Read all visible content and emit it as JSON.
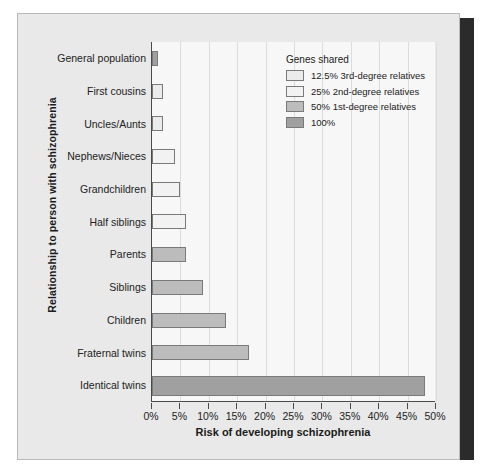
{
  "chart_data": {
    "type": "bar",
    "orientation": "horizontal",
    "title": "",
    "xlabel": "Risk of developing schizophrenia",
    "ylabel": "Relationship to person with schizophrenia",
    "xlim": [
      0,
      50
    ],
    "xtick_labels": [
      "0%",
      "5%",
      "10%",
      "15%",
      "20%",
      "25%",
      "30%",
      "35%",
      "40%",
      "45%",
      "50%"
    ],
    "xtick_values": [
      0,
      5,
      10,
      15,
      20,
      25,
      30,
      35,
      40,
      45,
      50
    ],
    "grid": "vertical",
    "categories": [
      "General population",
      "First cousins",
      "Uncles/Aunts",
      "Nephews/Nieces",
      "Grandchildren",
      "Half siblings",
      "Parents",
      "Siblings",
      "Children",
      "Fraternal twins",
      "Identical twins"
    ],
    "values": [
      1,
      2,
      2,
      4,
      5,
      6,
      6,
      9,
      13,
      17,
      48
    ],
    "group_of_bar": [
      "100%",
      "12.5% 3rd-degree relatives",
      "12.5% 3rd-degree relatives",
      "25% 2nd-degree relatives",
      "25% 2nd-degree relatives",
      "25% 2nd-degree relatives",
      "50% 1st-degree relatives",
      "50% 1st-degree relatives",
      "50% 1st-degree relatives",
      "50% 1st-degree relatives",
      "100%"
    ],
    "legend": {
      "title": "Genes shared",
      "position": "top-right",
      "entries": [
        {
          "label": "12.5% 3rd-degree relatives",
          "color": "#ebebeb"
        },
        {
          "label": "25% 2nd-degree relatives",
          "color": "#f2f2f2"
        },
        {
          "label": "50% 1st-degree relatives",
          "color": "#bcbcbc"
        },
        {
          "label": "100%",
          "color": "#a0a0a0"
        }
      ]
    },
    "colors": {
      "deg3": "#ebebeb",
      "deg2": "#f2f2f2",
      "deg1": "#bcbcbc",
      "full": "#a0a0a0",
      "bar_border": "#7a7a7a",
      "axis": "#4a4a4a",
      "grid": "#dcdcdc",
      "plot_background": "#f7f7f7",
      "panel_background": "#e9e9e9",
      "panel_border": "#b9b9b9",
      "shadow": "#2b2b2b"
    }
  }
}
